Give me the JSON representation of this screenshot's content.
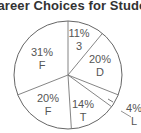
{
  "chart_data": {
    "type": "pie",
    "title": "Career Choices for Students",
    "slices": [
      {
        "label": "3",
        "value": 11,
        "text": "11%"
      },
      {
        "label": "D",
        "value": 20,
        "text": "20%"
      },
      {
        "label": "L",
        "value": 4,
        "text": "4%"
      },
      {
        "label": "T",
        "value": 14,
        "text": "14%"
      },
      {
        "label": "F",
        "value": 20,
        "text": "20%"
      },
      {
        "label": "F",
        "value": 31,
        "text": "31%"
      }
    ],
    "start_angle": "12 o'clock",
    "direction": "clockwise"
  },
  "labels": {
    "s0_pct": "11%",
    "s0_name": "3",
    "s1_pct": "20%",
    "s1_name": "D",
    "s2_pct": "4%",
    "s2_name": "L",
    "s3_pct": "14%",
    "s3_name": "T",
    "s4_pct": "20%",
    "s4_name": "F",
    "s5_pct": "31%",
    "s5_name": "F"
  }
}
